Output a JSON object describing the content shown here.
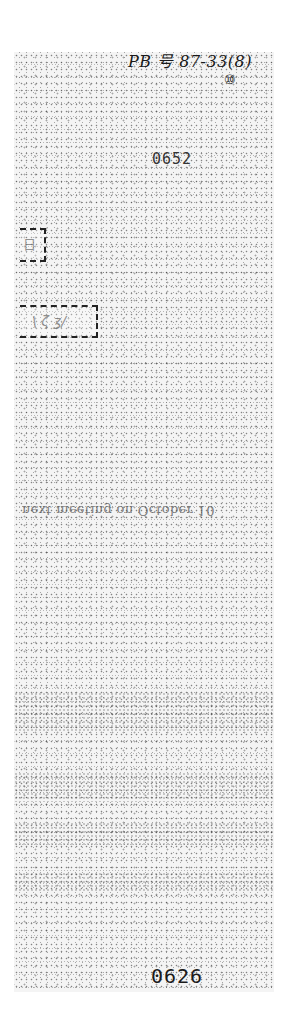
{
  "document": {
    "type": "scanned-page-strip",
    "handwritten_reference": "PB 号 87-33(8)",
    "handwritten_sub": "⑩",
    "stamped_number_top": "0652",
    "stamped_number_bottom": "0626",
    "boxes": [
      {
        "name": "small-box",
        "content": "日"
      },
      {
        "name": "wide-box",
        "content": "\\ ζ ʒ/"
      }
    ],
    "mirrored_text_line": "next meeting on October 10"
  },
  "colors": {
    "paper": "#ffffff",
    "speckle": "#2a2a2a",
    "ink": "#1a1a1a"
  }
}
